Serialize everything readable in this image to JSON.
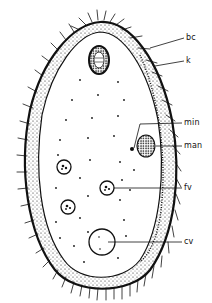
{
  "diagram": {
    "colors": {
      "ink": "#111111",
      "background": "#ffffff"
    },
    "labels": [
      {
        "id": "bc",
        "text": "bc",
        "x": 186,
        "y": 35,
        "line": [
          150,
          48,
          184,
          38
        ]
      },
      {
        "id": "k",
        "text": "k",
        "x": 186,
        "y": 58,
        "line": [
          155,
          66,
          184,
          61
        ]
      },
      {
        "id": "min",
        "text": "min",
        "x": 184,
        "y": 120,
        "line": [
          148,
          124,
          182,
          123
        ]
      },
      {
        "id": "man",
        "text": "man",
        "x": 184,
        "y": 143,
        "line": [
          163,
          146,
          182,
          146
        ]
      },
      {
        "id": "fv",
        "text": "fv",
        "x": 184,
        "y": 186,
        "line": [
          115,
          188,
          182,
          188
        ]
      },
      {
        "id": "cv",
        "text": "cv",
        "x": 184,
        "y": 240,
        "line": [
          110,
          242,
          182,
          242
        ]
      }
    ]
  }
}
